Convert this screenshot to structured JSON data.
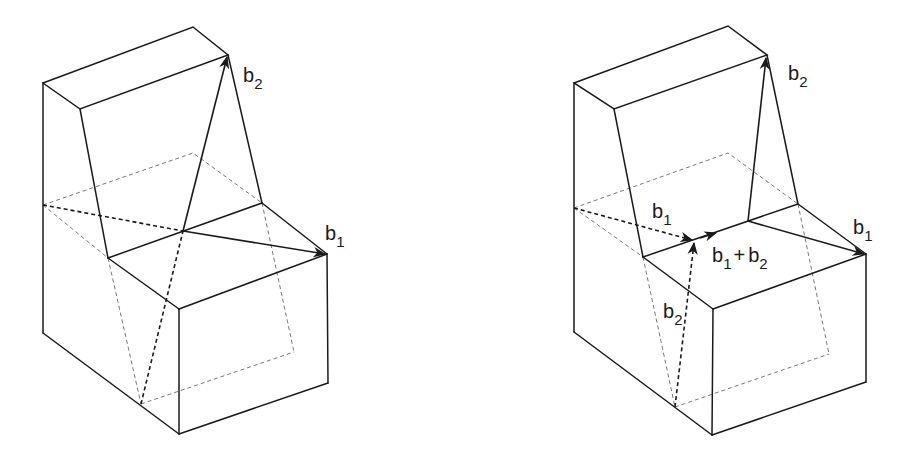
{
  "figures": [
    {
      "id": "left",
      "description": "Block with step; vectors b1 and b2 crossing diagonally",
      "labels": {
        "b2": {
          "base": "b",
          "sub": "2"
        },
        "b1": {
          "base": "b",
          "sub": "1"
        }
      }
    },
    {
      "id": "right",
      "description": "Same block showing vector sum b1 + b2 along step edge",
      "labels": {
        "b2_top": {
          "base": "b",
          "sub": "2"
        },
        "b1_right": {
          "base": "b",
          "sub": "1"
        },
        "b1_inner": {
          "base": "b",
          "sub": "1"
        },
        "sum": {
          "base1": "b",
          "sub1": "1",
          "op": "+",
          "base2": "b",
          "sub2": "2"
        },
        "b2_inner": {
          "base": "b",
          "sub": "2"
        }
      }
    }
  ],
  "colors": {
    "line": "#1a1a1a",
    "hidden_line": "#777777",
    "background": "#ffffff"
  }
}
